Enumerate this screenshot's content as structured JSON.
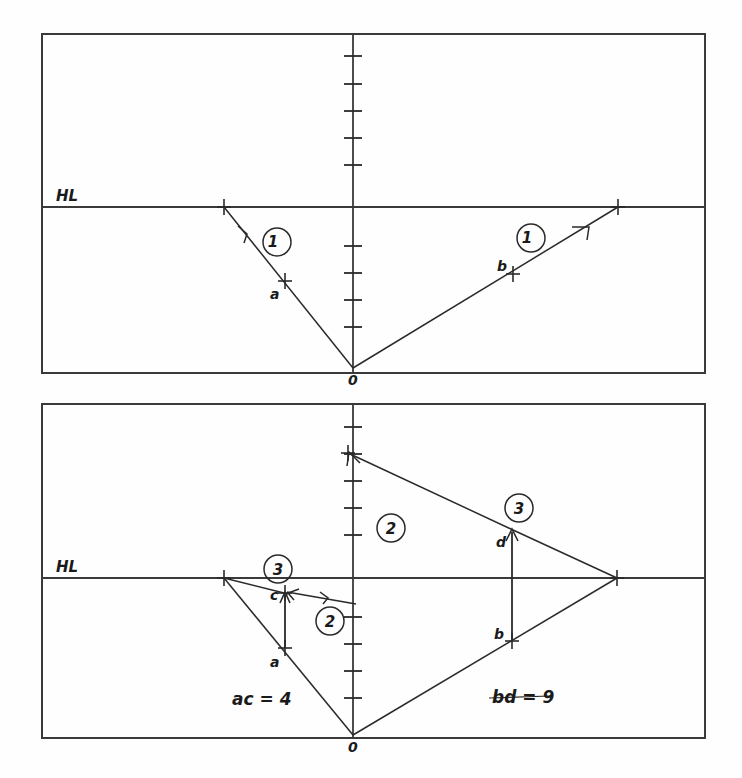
{
  "figure": {
    "background": "#fefefe",
    "ink": "#2a2a2a",
    "width": 742,
    "height": 778
  },
  "panels": [
    {
      "id": "top-panel",
      "frame": {
        "x": 42,
        "y": 34,
        "w": 663,
        "h": 339
      },
      "horizon_label": "HL",
      "horizon_label_pos": {
        "x": 56,
        "y": 200
      },
      "horizon_y": 207,
      "axis_x": 353,
      "origin_label": "0",
      "origin": {
        "x": 353,
        "y": 368
      },
      "ticks_above": [
        56,
        84,
        111,
        138,
        165
      ],
      "ticks_below": [
        246,
        273,
        300,
        327
      ],
      "rays": [
        {
          "name": "ray-left-1",
          "label": "1",
          "label_pos": {
            "x": 277,
            "y": 242
          },
          "from": {
            "x": 353,
            "y": 368
          },
          "to": {
            "x": 224,
            "y": 207
          },
          "arrow_at": {
            "x": 246,
            "y": 235
          },
          "points": [
            {
              "label": "a",
              "x": 285,
              "y": 281,
              "label_pos": {
                "x": 272,
                "y": 297
              }
            },
            {
              "label": "",
              "x": 224,
              "y": 207,
              "label_pos": {
                "x": 224,
                "y": 207
              }
            }
          ]
        },
        {
          "name": "ray-right-1",
          "label": "1",
          "label_pos": {
            "x": 531,
            "y": 238
          },
          "from": {
            "x": 353,
            "y": 368
          },
          "to": {
            "x": 618,
            "y": 207
          },
          "arrow_at": {
            "x": 583,
            "y": 229
          },
          "points": [
            {
              "label": "b",
              "x": 513,
              "y": 274,
              "label_pos": {
                "x": 500,
                "y": 268
              }
            },
            {
              "label": "",
              "x": 618,
              "y": 207,
              "label_pos": {
                "x": 618,
                "y": 207
              }
            }
          ]
        }
      ]
    },
    {
      "id": "bottom-panel",
      "frame": {
        "x": 42,
        "y": 404,
        "w": 663,
        "h": 334
      },
      "horizon_label": "HL",
      "horizon_label_pos": {
        "x": 56,
        "y": 571
      },
      "horizon_y": 578,
      "axis_x": 353,
      "origin_label": "0",
      "origin": {
        "x": 353,
        "y": 735
      },
      "ticks_above": [
        427,
        454,
        481,
        508,
        535
      ],
      "ticks_below": [
        617,
        644,
        671,
        698
      ],
      "measurements": [
        {
          "name": "measure-ac",
          "text": "ac = 4",
          "x": 232,
          "y": 700
        },
        {
          "name": "measure-bd",
          "text": "bd = 9",
          "x": 492,
          "y": 700
        }
      ],
      "rays": [
        {
          "name": "ray-left-lower-long",
          "label": "",
          "from": {
            "x": 353,
            "y": 735
          },
          "to": {
            "x": 224,
            "y": 578
          },
          "points": [
            {
              "label": "a",
              "x": 285,
              "y": 648,
              "label_pos": {
                "x": 272,
                "y": 665
              }
            }
          ]
        },
        {
          "name": "ray-left-2",
          "label": "2",
          "label_pos": {
            "x": 330,
            "y": 620
          },
          "from": {
            "x": 353,
            "y": 603
          },
          "to": {
            "x": 285,
            "y": 593
          },
          "arrow_at": {
            "x": 303,
            "y": 596
          }
        },
        {
          "name": "ray-left-3",
          "label": "3",
          "label_pos": {
            "x": 278,
            "y": 569
          },
          "from": {
            "x": 224,
            "y": 578
          },
          "to": {
            "x": 285,
            "y": 593
          },
          "points": [
            {
              "label": "c",
              "x": 285,
              "y": 593,
              "label_pos": {
                "x": 272,
                "y": 601
              }
            }
          ]
        },
        {
          "name": "vertical-ac",
          "label": "",
          "from": {
            "x": 285,
            "y": 648
          },
          "to": {
            "x": 285,
            "y": 593
          }
        },
        {
          "name": "ray-right-2",
          "label": "2",
          "label_pos": {
            "x": 390,
            "y": 527
          },
          "from": {
            "x": 512,
            "y": 529
          },
          "to": {
            "x": 348,
            "y": 453
          },
          "arrow_at": {
            "x": 374,
            "y": 465
          }
        },
        {
          "name": "ray-right-3",
          "label": "3",
          "label_pos": {
            "x": 518,
            "y": 508
          },
          "from": {
            "x": 617,
            "y": 578
          },
          "to": {
            "x": 512,
            "y": 529
          },
          "points": [
            {
              "label": "d",
              "x": 512,
              "y": 529,
              "label_pos": {
                "x": 498,
                "y": 545
              }
            }
          ]
        },
        {
          "name": "ray-right-lower-long",
          "label": "",
          "from": {
            "x": 353,
            "y": 735
          },
          "to": {
            "x": 617,
            "y": 578
          },
          "points": [
            {
              "label": "b",
              "x": 512,
              "y": 641,
              "label_pos": {
                "x": 497,
                "y": 638
              }
            }
          ]
        },
        {
          "name": "vertical-bd",
          "label": "",
          "from": {
            "x": 512,
            "y": 641
          },
          "to": {
            "x": 512,
            "y": 529
          }
        }
      ]
    }
  ]
}
